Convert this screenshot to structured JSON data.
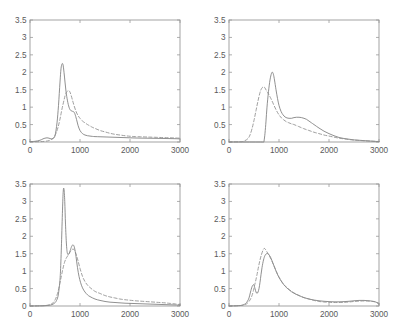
{
  "figure": {
    "layout": "2x2 grid of density plots",
    "panel_count": 4
  },
  "axes": {
    "x_ticks": [
      "0",
      "1000",
      "2000",
      "3000"
    ],
    "x_tick_values": [
      0,
      1000,
      2000,
      3000
    ],
    "y_ticks": [
      "0",
      "0.5",
      "1",
      "1.5",
      "2",
      "2.5",
      "3",
      "3.5"
    ],
    "y_tick_values": [
      0,
      0.5,
      1,
      1.5,
      2,
      2.5,
      3,
      3.5
    ],
    "xlim": [
      0,
      3000
    ],
    "ylim": [
      0,
      3.5
    ]
  },
  "style": {
    "solid_color": "#7c7c7c",
    "dashed_color": "#8e8e8e",
    "axis_color": "#9a9a9a",
    "label_color": "#5a5a5a",
    "background": "#ffffff"
  },
  "chart_data": [
    {
      "type": "line",
      "panel": "top-left",
      "title": "",
      "xlabel": "",
      "ylabel": "",
      "xlim": [
        0,
        3000
      ],
      "ylim": [
        0,
        3.5
      ],
      "grid": false,
      "legend": "none",
      "xticks": [
        0,
        1000,
        2000,
        3000
      ],
      "yticks": [
        0,
        0.5,
        1,
        1.5,
        2,
        2.5,
        3,
        3.5
      ],
      "series": [
        {
          "name": "solid",
          "style": "solid",
          "x": [
            0,
            100,
            200,
            260,
            300,
            340,
            380,
            420,
            460,
            500,
            540,
            570,
            600,
            620,
            640,
            660,
            680,
            700,
            720,
            750,
            780,
            800,
            820,
            850,
            880,
            900,
            930,
            960,
            1000,
            1050,
            1100,
            1150,
            1200,
            1250,
            1300,
            1400,
            1500,
            1600,
            1700,
            1800,
            1900,
            2000,
            2100,
            2200,
            2300,
            2400,
            2500,
            2600,
            2700,
            2800,
            2900,
            3000
          ],
          "y": [
            0.01,
            0.02,
            0.05,
            0.09,
            0.11,
            0.12,
            0.11,
            0.09,
            0.1,
            0.18,
            0.55,
            1.05,
            1.72,
            2.1,
            2.24,
            2.22,
            2.0,
            1.72,
            1.45,
            1.18,
            1.0,
            0.93,
            0.9,
            0.88,
            0.86,
            0.8,
            0.65,
            0.48,
            0.33,
            0.24,
            0.2,
            0.18,
            0.17,
            0.16,
            0.155,
            0.15,
            0.145,
            0.14,
            0.135,
            0.13,
            0.125,
            0.12,
            0.115,
            0.112,
            0.11,
            0.108,
            0.105,
            0.103,
            0.1,
            0.098,
            0.095,
            0.09
          ]
        },
        {
          "name": "dashed",
          "style": "dashed",
          "x": [
            0,
            200,
            300,
            380,
            440,
            480,
            520,
            560,
            600,
            640,
            680,
            700,
            720,
            740,
            760,
            780,
            800,
            820,
            850,
            880,
            920,
            960,
            1000,
            1050,
            1100,
            1150,
            1200,
            1250,
            1300,
            1400,
            1500,
            1600,
            1700,
            1800,
            1900,
            2000,
            2100,
            2200,
            2300,
            2400,
            2500,
            2600,
            2700,
            2800,
            2900,
            3000
          ],
          "y": [
            0.005,
            0.01,
            0.02,
            0.04,
            0.08,
            0.14,
            0.25,
            0.42,
            0.66,
            0.95,
            1.2,
            1.32,
            1.4,
            1.45,
            1.47,
            1.47,
            1.43,
            1.35,
            1.2,
            1.05,
            0.88,
            0.76,
            0.68,
            0.6,
            0.55,
            0.5,
            0.46,
            0.42,
            0.39,
            0.33,
            0.29,
            0.25,
            0.22,
            0.2,
            0.18,
            0.165,
            0.155,
            0.15,
            0.145,
            0.14,
            0.135,
            0.13,
            0.125,
            0.12,
            0.115,
            0.11
          ]
        }
      ]
    },
    {
      "type": "line",
      "panel": "top-right",
      "title": "",
      "xlabel": "",
      "ylabel": "",
      "xlim": [
        0,
        3000
      ],
      "ylim": [
        0,
        3.5
      ],
      "grid": false,
      "legend": "none",
      "xticks": [
        0,
        1000,
        2000,
        3000
      ],
      "yticks": [
        0,
        0.5,
        1,
        1.5,
        2,
        2.5,
        3,
        3.5
      ],
      "series": [
        {
          "name": "solid",
          "style": "solid",
          "x": [
            0,
            300,
            500,
            600,
            660,
            690,
            700,
            720,
            740,
            760,
            790,
            820,
            850,
            870,
            890,
            910,
            940,
            970,
            1000,
            1040,
            1080,
            1120,
            1160,
            1200,
            1250,
            1300,
            1350,
            1400,
            1450,
            1500,
            1550,
            1600,
            1650,
            1700,
            1800,
            1900,
            2000,
            2100,
            2200,
            2300,
            2400,
            2500,
            2600,
            2700,
            2800,
            2900,
            3000
          ],
          "y": [
            0.0,
            0.0,
            0.0,
            0.0,
            0.0,
            0.0,
            0.02,
            0.25,
            0.6,
            1.0,
            1.45,
            1.78,
            1.97,
            2.0,
            1.93,
            1.78,
            1.5,
            1.25,
            1.05,
            0.88,
            0.78,
            0.72,
            0.69,
            0.68,
            0.68,
            0.7,
            0.71,
            0.71,
            0.7,
            0.68,
            0.65,
            0.6,
            0.55,
            0.5,
            0.4,
            0.31,
            0.24,
            0.18,
            0.13,
            0.1,
            0.08,
            0.06,
            0.05,
            0.04,
            0.03,
            0.02,
            0.01
          ]
        },
        {
          "name": "dashed",
          "style": "dashed",
          "x": [
            0,
            250,
            320,
            380,
            420,
            460,
            500,
            540,
            580,
            620,
            650,
            680,
            700,
            720,
            750,
            780,
            800,
            830,
            860,
            900,
            950,
            1000,
            1050,
            1100,
            1150,
            1200,
            1250,
            1300,
            1400,
            1500,
            1600,
            1700,
            1800,
            1900,
            2000,
            2100,
            2200,
            2300,
            2400,
            2500,
            2600,
            2700,
            2800,
            2900,
            3000
          ],
          "y": [
            0.0,
            0.01,
            0.04,
            0.1,
            0.2,
            0.38,
            0.62,
            0.9,
            1.18,
            1.42,
            1.53,
            1.58,
            1.58,
            1.55,
            1.47,
            1.4,
            1.35,
            1.27,
            1.18,
            1.05,
            0.9,
            0.78,
            0.69,
            0.63,
            0.58,
            0.55,
            0.52,
            0.5,
            0.44,
            0.38,
            0.33,
            0.28,
            0.24,
            0.2,
            0.17,
            0.14,
            0.11,
            0.09,
            0.07,
            0.055,
            0.045,
            0.035,
            0.028,
            0.02,
            0.015
          ]
        }
      ]
    },
    {
      "type": "line",
      "panel": "bottom-left",
      "title": "",
      "xlabel": "",
      "ylabel": "",
      "xlim": [
        0,
        3000
      ],
      "ylim": [
        0,
        3.5
      ],
      "grid": false,
      "legend": "none",
      "xticks": [
        0,
        1000,
        2000,
        3000
      ],
      "yticks": [
        0,
        0.5,
        1,
        1.5,
        2,
        2.5,
        3,
        3.5
      ],
      "series": [
        {
          "name": "solid",
          "style": "solid",
          "x": [
            0,
            200,
            300,
            380,
            440,
            480,
            520,
            560,
            590,
            610,
            630,
            650,
            665,
            680,
            695,
            710,
            730,
            750,
            780,
            810,
            840,
            860,
            880,
            900,
            920,
            950,
            980,
            1010,
            1050,
            1100,
            1150,
            1200,
            1300,
            1400,
            1500,
            1600,
            1700,
            1800,
            1900,
            2000,
            2100,
            2200,
            2300,
            2400,
            2500,
            2600,
            2700,
            2800,
            2900,
            3000
          ],
          "y": [
            0.0,
            0.005,
            0.01,
            0.02,
            0.04,
            0.07,
            0.13,
            0.28,
            0.6,
            1.0,
            1.8,
            2.75,
            3.3,
            3.35,
            3.0,
            2.35,
            1.75,
            1.5,
            1.5,
            1.62,
            1.73,
            1.75,
            1.72,
            1.6,
            1.42,
            1.1,
            0.85,
            0.68,
            0.52,
            0.4,
            0.32,
            0.27,
            0.2,
            0.16,
            0.13,
            0.11,
            0.1,
            0.09,
            0.08,
            0.075,
            0.07,
            0.065,
            0.06,
            0.055,
            0.05,
            0.045,
            0.04,
            0.035,
            0.03,
            0.025
          ]
        },
        {
          "name": "dashed",
          "style": "dashed",
          "x": [
            0,
            200,
            320,
            400,
            460,
            510,
            550,
            590,
            630,
            660,
            690,
            720,
            750,
            780,
            810,
            840,
            860,
            880,
            900,
            930,
            960,
            1000,
            1050,
            1100,
            1150,
            1200,
            1300,
            1400,
            1500,
            1600,
            1700,
            1800,
            1900,
            2000,
            2100,
            2200,
            2300,
            2400,
            2500,
            2600,
            2700,
            2800,
            2900,
            3000
          ],
          "y": [
            0.0,
            0.005,
            0.015,
            0.04,
            0.09,
            0.2,
            0.36,
            0.6,
            0.88,
            1.08,
            1.25,
            1.36,
            1.43,
            1.5,
            1.57,
            1.62,
            1.63,
            1.62,
            1.58,
            1.45,
            1.3,
            1.08,
            0.85,
            0.7,
            0.6,
            0.53,
            0.42,
            0.36,
            0.3,
            0.26,
            0.23,
            0.2,
            0.18,
            0.165,
            0.15,
            0.14,
            0.13,
            0.12,
            0.11,
            0.1,
            0.09,
            0.075,
            0.06,
            0.04
          ]
        }
      ]
    },
    {
      "type": "line",
      "panel": "bottom-right",
      "title": "",
      "xlabel": "",
      "ylabel": "",
      "xlim": [
        0,
        3000
      ],
      "ylim": [
        0,
        3.5
      ],
      "grid": false,
      "legend": "none",
      "xticks": [
        0,
        1000,
        2000,
        3000
      ],
      "yticks": [
        0,
        0.5,
        1,
        1.5,
        2,
        2.5,
        3,
        3.5
      ],
      "series": [
        {
          "name": "solid",
          "style": "solid",
          "x": [
            0,
            200,
            280,
            330,
            370,
            400,
            430,
            460,
            485,
            500,
            520,
            540,
            560,
            580,
            600,
            620,
            640,
            660,
            690,
            720,
            750,
            780,
            800,
            830,
            860,
            900,
            950,
            1000,
            1060,
            1120,
            1180,
            1250,
            1320,
            1400,
            1500,
            1600,
            1700,
            1800,
            1900,
            2000,
            2100,
            2200,
            2300,
            2400,
            2500,
            2600,
            2700,
            2800,
            2900,
            2950,
            3000
          ],
          "y": [
            0.0,
            0.01,
            0.03,
            0.07,
            0.14,
            0.23,
            0.4,
            0.55,
            0.61,
            0.6,
            0.5,
            0.4,
            0.36,
            0.4,
            0.5,
            0.68,
            0.9,
            1.1,
            1.32,
            1.45,
            1.5,
            1.5,
            1.47,
            1.4,
            1.3,
            1.15,
            0.97,
            0.82,
            0.68,
            0.57,
            0.49,
            0.41,
            0.35,
            0.3,
            0.24,
            0.2,
            0.17,
            0.15,
            0.135,
            0.125,
            0.12,
            0.12,
            0.125,
            0.135,
            0.15,
            0.16,
            0.16,
            0.15,
            0.13,
            0.1,
            0.05
          ]
        },
        {
          "name": "dashed",
          "style": "dashed",
          "x": [
            0,
            200,
            300,
            350,
            400,
            430,
            460,
            490,
            510,
            530,
            560,
            590,
            620,
            650,
            680,
            700,
            720,
            740,
            760,
            790,
            820,
            860,
            900,
            950,
            1000,
            1060,
            1120,
            1180,
            1250,
            1320,
            1400,
            1500,
            1600,
            1700,
            1800,
            1900,
            2000,
            2100,
            2200,
            2300,
            2400,
            2500,
            2600,
            2700,
            2800,
            2900,
            2950,
            3000
          ],
          "y": [
            0.0,
            0.01,
            0.03,
            0.06,
            0.13,
            0.2,
            0.3,
            0.45,
            0.58,
            0.7,
            0.9,
            1.12,
            1.32,
            1.48,
            1.6,
            1.65,
            1.64,
            1.6,
            1.55,
            1.48,
            1.4,
            1.28,
            1.15,
            0.98,
            0.83,
            0.69,
            0.58,
            0.5,
            0.42,
            0.36,
            0.3,
            0.24,
            0.2,
            0.16,
            0.13,
            0.115,
            0.105,
            0.1,
            0.1,
            0.105,
            0.115,
            0.13,
            0.14,
            0.145,
            0.14,
            0.125,
            0.11,
            0.08
          ]
        }
      ]
    }
  ]
}
